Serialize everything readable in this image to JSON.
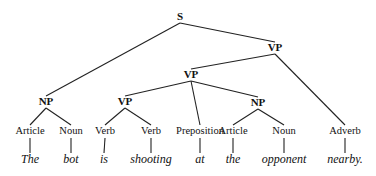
{
  "diagram": {
    "type": "parse-tree",
    "nodes": [
      {
        "id": "s",
        "label": "S",
        "kind": "phrase"
      },
      {
        "id": "vp1",
        "label": "VP",
        "kind": "phrase"
      },
      {
        "id": "vp2",
        "label": "VP",
        "kind": "phrase"
      },
      {
        "id": "np1",
        "label": "NP",
        "kind": "phrase"
      },
      {
        "id": "vp3",
        "label": "VP",
        "kind": "phrase"
      },
      {
        "id": "np2",
        "label": "NP",
        "kind": "phrase"
      },
      {
        "id": "art1",
        "label": "Article",
        "kind": "pos"
      },
      {
        "id": "noun1",
        "label": "Noun",
        "kind": "pos"
      },
      {
        "id": "verb1",
        "label": "Verb",
        "kind": "pos"
      },
      {
        "id": "verb2",
        "label": "Verb",
        "kind": "pos"
      },
      {
        "id": "prep",
        "label": "Preposition",
        "kind": "pos"
      },
      {
        "id": "art2",
        "label": "Article",
        "kind": "pos"
      },
      {
        "id": "noun2",
        "label": "Noun",
        "kind": "pos"
      },
      {
        "id": "adv",
        "label": "Adverb",
        "kind": "pos"
      },
      {
        "id": "w1",
        "label": "The",
        "kind": "word"
      },
      {
        "id": "w2",
        "label": "bot",
        "kind": "word"
      },
      {
        "id": "w3",
        "label": "is",
        "kind": "word"
      },
      {
        "id": "w4",
        "label": "shooting",
        "kind": "word"
      },
      {
        "id": "w5",
        "label": "at",
        "kind": "word"
      },
      {
        "id": "w6",
        "label": "the",
        "kind": "word"
      },
      {
        "id": "w7",
        "label": "opponent",
        "kind": "word"
      },
      {
        "id": "w8",
        "label": "nearby.",
        "kind": "word"
      }
    ],
    "edges": [
      [
        "s",
        "np1"
      ],
      [
        "s",
        "vp1"
      ],
      [
        "vp1",
        "vp2"
      ],
      [
        "vp1",
        "adv"
      ],
      [
        "vp2",
        "vp3"
      ],
      [
        "vp2",
        "prep"
      ],
      [
        "vp2",
        "np2"
      ],
      [
        "np1",
        "art1"
      ],
      [
        "np1",
        "noun1"
      ],
      [
        "vp3",
        "verb1"
      ],
      [
        "vp3",
        "verb2"
      ],
      [
        "np2",
        "art2"
      ],
      [
        "np2",
        "noun2"
      ],
      [
        "art1",
        "w1"
      ],
      [
        "noun1",
        "w2"
      ],
      [
        "verb1",
        "w3"
      ],
      [
        "verb2",
        "w4"
      ],
      [
        "prep",
        "w5"
      ],
      [
        "art2",
        "w6"
      ],
      [
        "noun2",
        "w7"
      ],
      [
        "adv",
        "w8"
      ]
    ]
  }
}
